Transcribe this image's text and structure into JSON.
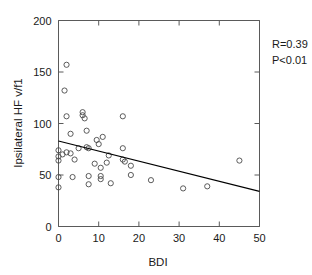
{
  "chart_data": {
    "type": "scatter",
    "title": "",
    "xlabel": "BDI",
    "ylabel": "Ipsilateral HF v/f1",
    "xlim": [
      0,
      50
    ],
    "ylim": [
      0,
      200
    ],
    "xticks": [
      0,
      10,
      20,
      30,
      40,
      50
    ],
    "yticks": [
      0,
      50,
      100,
      150,
      200
    ],
    "grid": false,
    "legend": null,
    "marker_style": "open-circle",
    "annotations": [
      "R=0.39",
      "P<0.01"
    ],
    "correlation_r": "R=0.39",
    "p_value": "P<0.01",
    "fit_line": {
      "type": "linear-regression",
      "x_start": 0,
      "y_start": 83,
      "x_end": 50,
      "y_end": 34
    },
    "points": [
      {
        "x": 0,
        "y": 38
      },
      {
        "x": 0,
        "y": 48
      },
      {
        "x": 0,
        "y": 64
      },
      {
        "x": 0,
        "y": 68
      },
      {
        "x": 0,
        "y": 74
      },
      {
        "x": 1,
        "y": 70
      },
      {
        "x": 1.5,
        "y": 132
      },
      {
        "x": 2,
        "y": 157
      },
      {
        "x": 2,
        "y": 107
      },
      {
        "x": 2,
        "y": 72
      },
      {
        "x": 3,
        "y": 90
      },
      {
        "x": 3,
        "y": 71
      },
      {
        "x": 3.5,
        "y": 48
      },
      {
        "x": 4,
        "y": 65
      },
      {
        "x": 5,
        "y": 76
      },
      {
        "x": 6,
        "y": 111
      },
      {
        "x": 6,
        "y": 108
      },
      {
        "x": 6.5,
        "y": 105
      },
      {
        "x": 7,
        "y": 93
      },
      {
        "x": 7,
        "y": 77
      },
      {
        "x": 7.5,
        "y": 76
      },
      {
        "x": 7.5,
        "y": 49
      },
      {
        "x": 7.5,
        "y": 41
      },
      {
        "x": 9,
        "y": 61
      },
      {
        "x": 9.5,
        "y": 84
      },
      {
        "x": 10,
        "y": 80
      },
      {
        "x": 10.5,
        "y": 57
      },
      {
        "x": 10.5,
        "y": 49
      },
      {
        "x": 10.5,
        "y": 46
      },
      {
        "x": 11,
        "y": 87
      },
      {
        "x": 12,
        "y": 62
      },
      {
        "x": 12.5,
        "y": 69
      },
      {
        "x": 13,
        "y": 42
      },
      {
        "x": 16,
        "y": 107
      },
      {
        "x": 16,
        "y": 76
      },
      {
        "x": 16,
        "y": 65
      },
      {
        "x": 16.5,
        "y": 63
      },
      {
        "x": 18,
        "y": 59
      },
      {
        "x": 18,
        "y": 50
      },
      {
        "x": 23,
        "y": 45
      },
      {
        "x": 31,
        "y": 37
      },
      {
        "x": 37,
        "y": 39
      },
      {
        "x": 45,
        "y": 64
      }
    ]
  }
}
